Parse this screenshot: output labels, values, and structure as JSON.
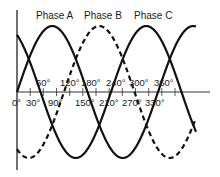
{
  "diagram": {
    "type": "three-phase sine waveforms",
    "colors": {
      "stroke": "#111111",
      "background": "#ffffff"
    },
    "phases": [
      {
        "name": "Phase A",
        "style": "solid",
        "phase_shift_deg": 0
      },
      {
        "name": "Phase B",
        "style": "dashed",
        "phase_shift_deg": -120
      },
      {
        "name": "Phase C",
        "style": "solid",
        "phase_shift_deg": 120
      }
    ],
    "axis": {
      "labels_above": [
        "60°",
        "120°",
        "180°",
        "240°",
        "300°",
        "360°"
      ],
      "labels_below": [
        "0°",
        "30°",
        "90°",
        "150°",
        "210°",
        "270°",
        "330°"
      ]
    }
  },
  "labels": {
    "phase_a": "Phase A",
    "phase_b": "Phase B",
    "phase_c": "Phase C",
    "above": {
      "d60": "60°",
      "d120": "120°",
      "d180": "180°",
      "d240": "240°",
      "d300": "300°",
      "d360": "360°"
    },
    "below": {
      "d0": "0°",
      "d30": "30°",
      "d90": "90°",
      "d150": "150°",
      "d210": "210°",
      "d270": "270°",
      "d330": "330°"
    }
  }
}
